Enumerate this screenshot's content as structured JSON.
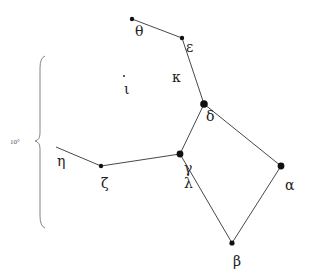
{
  "diagram": {
    "colors": {
      "line": "#333333",
      "star": "#111111",
      "label": "#222222",
      "brace": "#777777"
    },
    "scale": {
      "label": "10°",
      "x": 30,
      "y": 144,
      "brace_top": 56,
      "brace_bottom": 228,
      "brace_x": 40,
      "cusp_y": 141
    },
    "stars": [
      {
        "id": "theta",
        "label": "θ",
        "x": 132,
        "y": 19,
        "r": 2.2,
        "lx": 135,
        "ly": 36
      },
      {
        "id": "epsilon",
        "label": "ε",
        "x": 182,
        "y": 38,
        "r": 2.2,
        "lx": 186,
        "ly": 52
      },
      {
        "id": "kappa",
        "label": "κ",
        "x": null,
        "y": null,
        "r": 0,
        "lx": 172,
        "ly": 82
      },
      {
        "id": "iota",
        "label": "ι",
        "x": 124,
        "y": 76,
        "r": 0.9,
        "lx": 124,
        "ly": 94
      },
      {
        "id": "delta",
        "label": "δ",
        "x": 204,
        "y": 104,
        "r": 3.8,
        "lx": 206,
        "ly": 121
      },
      {
        "id": "gamma",
        "label": "γ",
        "x": 180,
        "y": 154,
        "r": 3.4,
        "lx": 184,
        "ly": 173
      },
      {
        "id": "lambda",
        "label": "λ",
        "x": null,
        "y": null,
        "r": 0,
        "lx": 184,
        "ly": 188
      },
      {
        "id": "zeta",
        "label": "ζ",
        "x": 101,
        "y": 166,
        "r": 2.2,
        "lx": 101,
        "ly": 188
      },
      {
        "id": "eta",
        "label": "η",
        "x": 56,
        "y": 147,
        "r": 0,
        "lx": 57,
        "ly": 166
      },
      {
        "id": "alpha",
        "label": "α",
        "x": 281,
        "y": 166,
        "r": 3.4,
        "lx": 285,
        "ly": 190
      },
      {
        "id": "beta",
        "label": "β",
        "x": 232,
        "y": 243,
        "r": 2.6,
        "lx": 233,
        "ly": 266
      }
    ],
    "edges": [
      [
        "theta",
        "epsilon"
      ],
      [
        "epsilon",
        "delta"
      ],
      [
        "delta",
        "gamma"
      ],
      [
        "delta",
        "alpha"
      ],
      [
        "gamma",
        "zeta"
      ],
      [
        "zeta",
        "eta"
      ],
      [
        "gamma",
        "beta"
      ],
      [
        "alpha",
        "beta"
      ]
    ]
  }
}
